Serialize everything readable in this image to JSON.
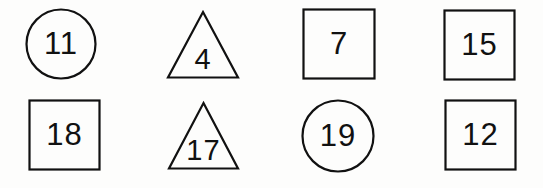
{
  "worksheet": {
    "background_color": "#fdfdfc",
    "ink_color": "#111111",
    "rows": 2,
    "columns": 4,
    "items": [
      {
        "shape": "circle",
        "shape_icon": "circle-outline-icon",
        "number": "11",
        "row": 1,
        "column": 1
      },
      {
        "shape": "triangle",
        "shape_icon": "triangle-outline-icon",
        "number": "4",
        "row": 1,
        "column": 2
      },
      {
        "shape": "square",
        "shape_icon": "square-outline-icon",
        "number": "7",
        "row": 1,
        "column": 3
      },
      {
        "shape": "square",
        "shape_icon": "square-outline-icon",
        "number": "15",
        "row": 1,
        "column": 4
      },
      {
        "shape": "square",
        "shape_icon": "square-outline-icon",
        "number": "18",
        "row": 2,
        "column": 1
      },
      {
        "shape": "triangle",
        "shape_icon": "triangle-outline-icon",
        "number": "17",
        "row": 2,
        "column": 2
      },
      {
        "shape": "circle",
        "shape_icon": "circle-outline-icon",
        "number": "19",
        "row": 2,
        "column": 3
      },
      {
        "shape": "square",
        "shape_icon": "square-outline-icon",
        "number": "12",
        "row": 2,
        "column": 4
      }
    ]
  }
}
